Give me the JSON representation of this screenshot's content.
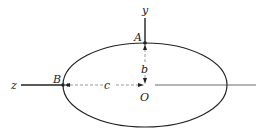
{
  "diagram": {
    "labels": {
      "y_axis": "y",
      "z_axis": "z",
      "point_a": "A",
      "point_b": "B",
      "origin": "O",
      "semi_axis_b": "b",
      "semi_axis_c": "c"
    },
    "colors": {
      "line": "#222222",
      "background": "#ffffff"
    }
  }
}
